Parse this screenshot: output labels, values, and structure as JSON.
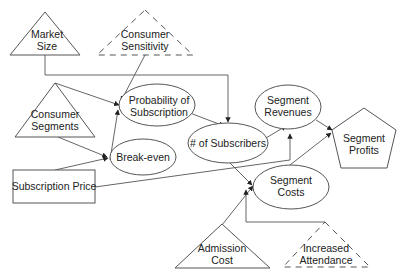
{
  "diagram": {
    "type": "influence-diagram",
    "colors": {
      "stroke": "#555555",
      "text": "#222222",
      "background": "#ffffff"
    },
    "nodes": {
      "market_size": {
        "shape": "triangle",
        "style": "solid",
        "line1": "Market",
        "line2": "Size"
      },
      "consumer_sensitivity": {
        "shape": "triangle",
        "style": "dashed",
        "line1": "Consumer",
        "line2": "Sensitivity"
      },
      "consumer_segments": {
        "shape": "triangle",
        "style": "solid",
        "line1": "Consumer",
        "line2": "Segments"
      },
      "probability_of_subscription": {
        "shape": "ellipse",
        "line1": "Probability of",
        "line2": "Subscription"
      },
      "break_even": {
        "shape": "ellipse",
        "line1": "Break-even"
      },
      "subscription_price": {
        "shape": "rectangle",
        "line1": "Subscription Price"
      },
      "num_subscribers": {
        "shape": "ellipse",
        "line1": "# of Subscribers"
      },
      "segment_revenues": {
        "shape": "ellipse",
        "line1": "Segment",
        "line2": "Revenues"
      },
      "segment_costs": {
        "shape": "ellipse",
        "line1": "Segment",
        "line2": "Costs"
      },
      "segment_profits": {
        "shape": "pentagon",
        "line1": "Segment",
        "line2": "Profits"
      },
      "admission_cost": {
        "shape": "triangle",
        "style": "solid",
        "line1": "Admission",
        "line2": "Cost"
      },
      "increased_attendance": {
        "shape": "triangle",
        "style": "dashed",
        "line1": "Increased",
        "line2": "Attendance"
      }
    },
    "edges": [
      {
        "from": "Market Size",
        "to": "# of Subscribers"
      },
      {
        "from": "Consumer Sensitivity",
        "to": "Probability of Subscription"
      },
      {
        "from": "Consumer Segments",
        "to": "Probability of Subscription"
      },
      {
        "from": "Consumer Segments",
        "to": "Break-even"
      },
      {
        "from": "Subscription Price",
        "to": "Break-even"
      },
      {
        "from": "Subscription Price",
        "to": "Segment Revenues"
      },
      {
        "from": "Probability of Subscription",
        "to": "# of Subscribers"
      },
      {
        "from": "# of Subscribers",
        "to": "Segment Revenues"
      },
      {
        "from": "# of Subscribers",
        "to": "Segment Costs"
      },
      {
        "from": "Admission Cost",
        "to": "Segment Costs"
      },
      {
        "from": "Increased Attendance",
        "to": "Segment Costs"
      },
      {
        "from": "Segment Revenues",
        "to": "Segment Profits"
      },
      {
        "from": "Segment Costs",
        "to": "Segment Profits"
      }
    ]
  }
}
